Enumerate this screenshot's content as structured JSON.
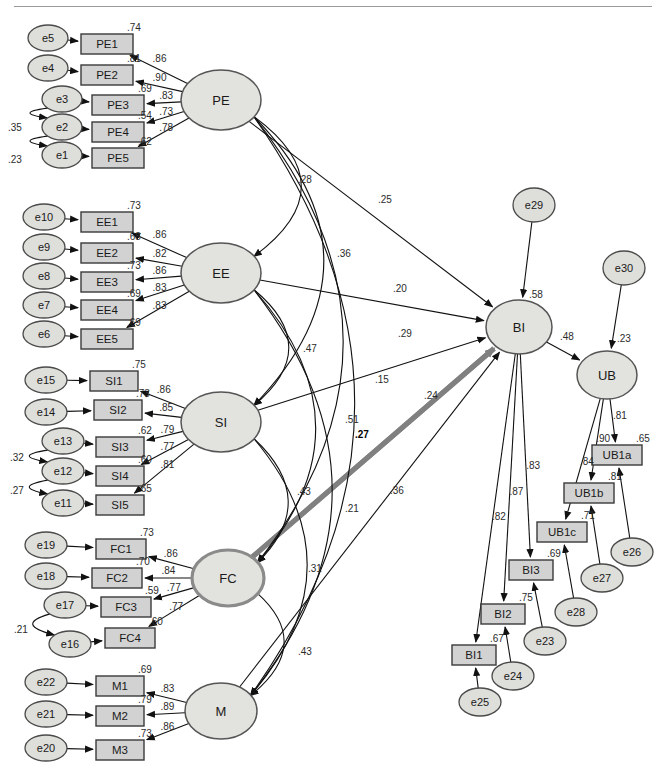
{
  "diagram": {
    "type": "sem-path-diagram"
  },
  "latents": [
    {
      "id": "PE",
      "label": "PE",
      "cx": 221,
      "cy": 100,
      "rx": 40,
      "ry": 30
    },
    {
      "id": "EE",
      "label": "EE",
      "cx": 221,
      "cy": 273,
      "rx": 40,
      "ry": 30
    },
    {
      "id": "SI",
      "label": "SI",
      "cx": 221,
      "cy": 422,
      "rx": 40,
      "ry": 30
    },
    {
      "id": "FC",
      "label": "FC",
      "cx": 228,
      "cy": 578,
      "rx": 36,
      "ry": 28,
      "emphasis": true
    },
    {
      "id": "M",
      "label": "M",
      "cx": 221,
      "cy": 711,
      "rx": 36,
      "ry": 28
    },
    {
      "id": "BI",
      "label": "BI",
      "cx": 519,
      "cy": 327,
      "rx": 33,
      "ry": 27
    },
    {
      "id": "UB",
      "label": "UB",
      "cx": 607,
      "cy": 375,
      "rx": 30,
      "ry": 24
    }
  ],
  "indicators": [
    {
      "id": "PE1",
      "label": "PE1",
      "x": 81,
      "y": 34,
      "w": 52,
      "h": 20,
      "r2": ".74",
      "loading": ".86"
    },
    {
      "id": "PE2",
      "label": "PE2",
      "x": 81,
      "y": 65,
      "w": 52,
      "h": 20,
      "r2": ".81",
      "loading": ".90"
    },
    {
      "id": "PE3",
      "label": "PE3",
      "x": 92,
      "y": 95,
      "w": 52,
      "h": 20,
      "r2": ".69",
      "loading": ".83"
    },
    {
      "id": "PE4",
      "label": "PE4",
      "x": 92,
      "y": 122,
      "w": 52,
      "h": 20,
      "r2": ".54",
      "loading": ".73"
    },
    {
      "id": "PE5",
      "label": "PE5",
      "x": 92,
      "y": 148,
      "w": 52,
      "h": 20,
      "r2": ".62",
      "loading": ".78"
    },
    {
      "id": "EE1",
      "label": "EE1",
      "x": 81,
      "y": 212,
      "w": 52,
      "h": 20,
      "r2": ".73",
      "loading": ".86"
    },
    {
      "id": "EE2",
      "label": "EE2",
      "x": 81,
      "y": 243,
      "w": 52,
      "h": 20,
      "r2": ".68",
      "loading": ".82"
    },
    {
      "id": "EE3",
      "label": "EE3",
      "x": 81,
      "y": 272,
      "w": 52,
      "h": 20,
      "r2": ".73",
      "loading": ".86"
    },
    {
      "id": "EE4",
      "label": "EE4",
      "x": 81,
      "y": 300,
      "w": 52,
      "h": 20,
      "r2": ".69",
      "loading": ".83"
    },
    {
      "id": "EE5",
      "label": "EE5",
      "x": 81,
      "y": 329,
      "w": 52,
      "h": 20,
      "r2": ".69",
      "loading": ".83"
    },
    {
      "id": "SI1",
      "label": "SI1",
      "x": 90,
      "y": 371,
      "w": 48,
      "h": 20,
      "r2": ".75",
      "loading": ".86"
    },
    {
      "id": "SI2",
      "label": "SI2",
      "x": 94,
      "y": 400,
      "w": 48,
      "h": 20,
      "r2": ".73",
      "loading": ".85"
    },
    {
      "id": "SI3",
      "label": "SI3",
      "x": 96,
      "y": 437,
      "w": 48,
      "h": 20,
      "r2": ".62",
      "loading": ".79"
    },
    {
      "id": "SI4",
      "label": "SI4",
      "x": 96,
      "y": 466,
      "w": 48,
      "h": 20,
      "r2": ".60",
      "loading": ".77"
    },
    {
      "id": "SI5",
      "label": "SI5",
      "x": 96,
      "y": 495,
      "w": 48,
      "h": 20,
      "r2": ".65",
      "loading": ".81"
    },
    {
      "id": "FC1",
      "label": "FC1",
      "x": 96,
      "y": 539,
      "w": 50,
      "h": 20,
      "r2": ".73",
      "loading": ".86"
    },
    {
      "id": "FC2",
      "label": "FC2",
      "x": 92,
      "y": 568,
      "w": 50,
      "h": 20,
      "r2": ".70",
      "loading": ".84"
    },
    {
      "id": "FC3",
      "label": "FC3",
      "x": 101,
      "y": 597,
      "w": 50,
      "h": 20,
      "r2": ".59",
      "loading": ".77"
    },
    {
      "id": "FC4",
      "label": "FC4",
      "x": 105,
      "y": 628,
      "w": 50,
      "h": 20,
      "r2": ".60",
      "loading": ".77"
    },
    {
      "id": "M1",
      "label": "M1",
      "x": 96,
      "y": 676,
      "w": 48,
      "h": 20,
      "r2": ".69",
      "loading": ".83"
    },
    {
      "id": "M2",
      "label": "M2",
      "x": 96,
      "y": 706,
      "w": 48,
      "h": 20,
      "r2": ".79",
      "loading": ".89"
    },
    {
      "id": "M3",
      "label": "M3",
      "x": 96,
      "y": 740,
      "w": 48,
      "h": 20,
      "r2": ".73",
      "loading": ".86"
    },
    {
      "id": "BI1",
      "label": "BI1",
      "x": 452,
      "y": 645,
      "w": 44,
      "h": 20,
      "r2": ".67",
      "loading": ".82"
    },
    {
      "id": "BI2",
      "label": "BI2",
      "x": 481,
      "y": 604,
      "w": 44,
      "h": 20,
      "r2": ".75",
      "loading": ".87"
    },
    {
      "id": "BI3",
      "label": "BI3",
      "x": 509,
      "y": 560,
      "w": 44,
      "h": 20,
      "r2": ".69",
      "loading": ".83"
    },
    {
      "id": "UB1c",
      "label": "UB1c",
      "x": 537,
      "y": 522,
      "w": 50,
      "h": 20,
      "r2": ".71",
      "loading": ".84"
    },
    {
      "id": "UB1b",
      "label": "UB1b",
      "x": 564,
      "y": 483,
      "w": 50,
      "h": 20,
      "r2": ".81",
      "loading": ".90"
    },
    {
      "id": "UB1a",
      "label": "UB1a",
      "x": 592,
      "y": 445,
      "w": 50,
      "h": 20,
      "r2": ".65",
      "loading": ".81"
    }
  ],
  "errors": [
    {
      "id": "e5",
      "label": "e5",
      "cx": 48,
      "cy": 38,
      "rx": 20,
      "ry": 13
    },
    {
      "id": "e4",
      "label": "e4",
      "cx": 48,
      "cy": 68,
      "rx": 20,
      "ry": 13
    },
    {
      "id": "e3",
      "label": "e3",
      "cx": 62,
      "cy": 99,
      "rx": 20,
      "ry": 13
    },
    {
      "id": "e2",
      "label": "e2",
      "cx": 62,
      "cy": 127,
      "rx": 20,
      "ry": 13
    },
    {
      "id": "e1",
      "label": "e1",
      "cx": 62,
      "cy": 155,
      "rx": 20,
      "ry": 13
    },
    {
      "id": "e10",
      "label": "e10",
      "cx": 44,
      "cy": 217,
      "rx": 21,
      "ry": 13
    },
    {
      "id": "e9",
      "label": "e9",
      "cx": 44,
      "cy": 247,
      "rx": 21,
      "ry": 13
    },
    {
      "id": "e8",
      "label": "e8",
      "cx": 44,
      "cy": 276,
      "rx": 21,
      "ry": 13
    },
    {
      "id": "e7",
      "label": "e7",
      "cx": 44,
      "cy": 305,
      "rx": 21,
      "ry": 13
    },
    {
      "id": "e6",
      "label": "e6",
      "cx": 44,
      "cy": 334,
      "rx": 21,
      "ry": 13
    },
    {
      "id": "e15",
      "label": "e15",
      "cx": 46,
      "cy": 380,
      "rx": 21,
      "ry": 13
    },
    {
      "id": "e14",
      "label": "e14",
      "cx": 46,
      "cy": 412,
      "rx": 21,
      "ry": 13
    },
    {
      "id": "e13",
      "label": "e13",
      "cx": 63,
      "cy": 441,
      "rx": 21,
      "ry": 13
    },
    {
      "id": "e12",
      "label": "e12",
      "cx": 63,
      "cy": 471,
      "rx": 21,
      "ry": 13
    },
    {
      "id": "e11",
      "label": "e11",
      "cx": 63,
      "cy": 503,
      "rx": 21,
      "ry": 13
    },
    {
      "id": "e19",
      "label": "e19",
      "cx": 46,
      "cy": 545,
      "rx": 21,
      "ry": 13
    },
    {
      "id": "e18",
      "label": "e18",
      "cx": 46,
      "cy": 576,
      "rx": 21,
      "ry": 13
    },
    {
      "id": "e17",
      "label": "e17",
      "cx": 65,
      "cy": 605,
      "rx": 21,
      "ry": 13
    },
    {
      "id": "e16",
      "label": "e16",
      "cx": 70,
      "cy": 644,
      "rx": 21,
      "ry": 13
    },
    {
      "id": "e22",
      "label": "e22",
      "cx": 46,
      "cy": 682,
      "rx": 21,
      "ry": 13
    },
    {
      "id": "e21",
      "label": "e21",
      "cx": 46,
      "cy": 714,
      "rx": 21,
      "ry": 13
    },
    {
      "id": "e20",
      "label": "e20",
      "cx": 46,
      "cy": 748,
      "rx": 21,
      "ry": 13
    },
    {
      "id": "e29",
      "label": "e29",
      "cx": 534,
      "cy": 205,
      "rx": 21,
      "ry": 17
    },
    {
      "id": "e30",
      "label": "e30",
      "cx": 624,
      "cy": 268,
      "rx": 21,
      "ry": 17
    },
    {
      "id": "e25",
      "label": "e25",
      "cx": 480,
      "cy": 702,
      "rx": 21,
      "ry": 14
    },
    {
      "id": "e24",
      "label": "e24",
      "cx": 513,
      "cy": 676,
      "rx": 21,
      "ry": 14
    },
    {
      "id": "e23",
      "label": "e23",
      "cx": 545,
      "cy": 641,
      "rx": 21,
      "ry": 14
    },
    {
      "id": "e28",
      "label": "e28",
      "cx": 576,
      "cy": 612,
      "rx": 21,
      "ry": 14
    },
    {
      "id": "e27",
      "label": "e27",
      "cx": 602,
      "cy": 578,
      "rx": 21,
      "ry": 14
    },
    {
      "id": "e26",
      "label": "e26",
      "cx": 632,
      "cy": 552,
      "rx": 21,
      "ry": 14
    }
  ],
  "structural_paths": [
    {
      "from": "PE",
      "to": "BI",
      "coef": ".25",
      "label_x": 378,
      "label_y": 203
    },
    {
      "from": "EE",
      "to": "BI",
      "coef": ".20",
      "label_x": 393,
      "label_y": 292
    },
    {
      "from": "SI",
      "to": "BI",
      "coef": ".15",
      "label_x": 375,
      "label_y": 383
    },
    {
      "from": "FC",
      "to": "BI",
      "coef": ".24",
      "label_x": 424,
      "label_y": 399,
      "highlight": true
    },
    {
      "from": "M",
      "to": "BI",
      "coef": ".21",
      "label_x": 345,
      "label_y": 512
    },
    {
      "from": "BI",
      "to": "UB",
      "coef": ".48",
      "label_x": 560,
      "label_y": 340
    }
  ],
  "endogenous_r2": [
    {
      "id": "BI",
      "value": ".58",
      "x": 529,
      "y": 298
    },
    {
      "id": "UB",
      "value": ".23",
      "x": 617,
      "y": 342
    }
  ],
  "covariances": [
    {
      "between": "PE-EE",
      "coef": ".28",
      "label_x": 298,
      "label_y": 183
    },
    {
      "between": "PE-SI",
      "coef": ".36",
      "label_x": 337,
      "label_y": 257
    },
    {
      "between": "PE-FC",
      "coef": ".29",
      "label_x": 398,
      "label_y": 337
    },
    {
      "between": "PE-M",
      "coef": ".36",
      "label_x": 390,
      "label_y": 494
    },
    {
      "between": "EE-SI",
      "coef": ".47",
      "label_x": 303,
      "label_y": 352
    },
    {
      "between": "EE-FC",
      "coef": ".51",
      "label_x": 345,
      "label_y": 423
    },
    {
      "between": "EE-M",
      "coef": ".31",
      "label_x": 308,
      "label_y": 572
    },
    {
      "between": "SI-FC",
      "coef": ".43",
      "label_x": 297,
      "label_y": 495
    },
    {
      "between": "SI-M",
      "coef": ".27",
      "label_x": 355,
      "label_y": 438,
      "bold": true
    },
    {
      "between": "FC-M",
      "coef": ".43",
      "label_x": 298,
      "label_y": 655
    },
    {
      "between": "e3-e2",
      "coef": ".35",
      "label_x": 8,
      "label_y": 131
    },
    {
      "between": "e2-e1",
      "coef": ".23",
      "label_x": 8,
      "label_y": 163
    },
    {
      "between": "e13-e12",
      "coef": ".32",
      "label_x": 10,
      "label_y": 461
    },
    {
      "between": "e12-e11",
      "coef": ".27",
      "label_x": 10,
      "label_y": 494
    },
    {
      "between": "e17-e16",
      "coef": ".21",
      "label_x": 14,
      "label_y": 633
    }
  ],
  "colors": {
    "box_fill": "#d2d2d2",
    "ellipse_fill": "#dededa",
    "stroke": "#111111",
    "highlight_path": "#808080"
  }
}
